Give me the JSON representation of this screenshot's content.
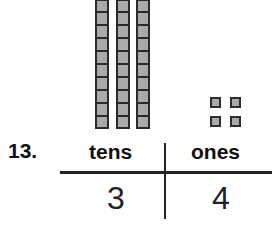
{
  "problem": {
    "number": "13.",
    "place_value_chart": {
      "headers": {
        "tens": "tens",
        "ones": "ones"
      },
      "values": {
        "tens": "3",
        "ones": "4"
      }
    },
    "blocks": {
      "ten_rods": 3,
      "unit_cubes": 4
    }
  },
  "colors": {
    "block_fill": "#a9a9a9",
    "block_border": "#2a2a2a",
    "ink": "#111111"
  }
}
